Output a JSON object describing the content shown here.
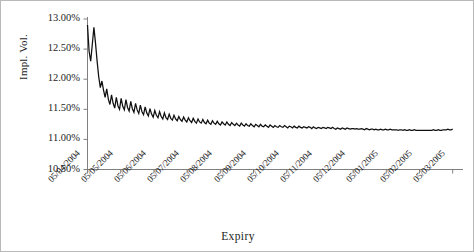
{
  "chart_data": {
    "type": "line",
    "title": "",
    "xlabel": "Expiry",
    "ylabel": "Impl. Vol.",
    "grid": false,
    "legend": false,
    "ylim": [
      10.5,
      13.0
    ],
    "ytick_labels": [
      "13.00%",
      "12.50%",
      "12.00%",
      "11.50%",
      "11.00%",
      "10.50%"
    ],
    "ytick_values": [
      13.0,
      12.5,
      12.0,
      11.5,
      11.0,
      10.5
    ],
    "xtick_labels": [
      "05/04/2004",
      "05/05/2004",
      "05/06/2004",
      "05/07/2004",
      "05/08/2004",
      "05/09/2004",
      "05/10/2004",
      "05/11/2004",
      "05/12/2004",
      "05/01/2005",
      "05/02/2005",
      "05/03/2005"
    ],
    "series": [
      {
        "name": "Implied Volatility",
        "color": "#101010",
        "values": [
          12.9,
          12.46,
          12.3,
          12.58,
          12.86,
          12.6,
          12.3,
          12.04,
          11.86,
          11.97,
          11.82,
          11.7,
          11.84,
          11.67,
          11.58,
          11.74,
          11.6,
          11.52,
          11.7,
          11.56,
          11.5,
          11.68,
          11.55,
          11.49,
          11.66,
          11.53,
          11.47,
          11.63,
          11.51,
          11.45,
          11.6,
          11.49,
          11.43,
          11.57,
          11.46,
          11.41,
          11.54,
          11.44,
          11.39,
          11.51,
          11.42,
          11.37,
          11.48,
          11.4,
          11.36,
          11.46,
          11.38,
          11.34,
          11.44,
          11.36,
          11.33,
          11.42,
          11.35,
          11.32,
          11.4,
          11.34,
          11.31,
          11.38,
          11.33,
          11.3,
          11.37,
          11.32,
          11.29,
          11.36,
          11.31,
          11.28,
          11.35,
          11.3,
          11.27,
          11.34,
          11.29,
          11.27,
          11.33,
          11.28,
          11.26,
          11.32,
          11.27,
          11.25,
          11.31,
          11.27,
          11.25,
          11.3,
          11.26,
          11.24,
          11.29,
          11.26,
          11.24,
          11.29,
          11.25,
          11.23,
          11.28,
          11.25,
          11.23,
          11.27,
          11.24,
          11.22,
          11.27,
          11.24,
          11.22,
          11.26,
          11.23,
          11.22,
          11.26,
          11.23,
          11.21,
          11.25,
          11.23,
          11.21,
          11.25,
          11.22,
          11.21,
          11.24,
          11.22,
          11.2,
          11.24,
          11.22,
          11.2,
          11.23,
          11.21,
          11.2,
          11.23,
          11.21,
          11.2,
          11.23,
          11.21,
          11.19,
          11.22,
          11.21,
          11.19,
          11.22,
          11.2,
          11.19,
          11.22,
          11.2,
          11.19,
          11.21,
          11.2,
          11.19,
          11.21,
          11.2,
          11.18,
          11.21,
          11.19,
          11.18,
          11.2,
          11.19,
          11.18,
          11.2,
          11.19,
          11.18,
          11.2,
          11.19,
          11.18,
          11.2,
          11.18,
          11.17,
          11.19,
          11.18,
          11.17,
          11.19,
          11.18,
          11.17,
          11.19,
          11.18,
          11.17,
          11.18,
          11.18,
          11.17,
          11.18,
          11.17,
          11.17,
          11.18,
          11.17,
          11.16,
          11.18,
          11.17,
          11.16,
          11.17,
          11.17,
          11.16,
          11.17,
          11.16,
          11.16,
          11.17,
          11.16,
          11.16,
          11.17,
          11.16,
          11.16,
          11.17,
          11.16,
          11.16,
          11.16,
          11.16,
          11.15,
          11.16,
          11.16,
          11.15,
          11.16,
          11.15,
          11.15,
          11.16,
          11.15,
          11.15,
          11.16,
          11.15,
          11.15,
          11.15,
          11.15,
          11.15,
          11.15,
          11.15,
          11.15,
          11.15,
          11.15,
          11.15,
          11.16,
          11.15,
          11.15,
          11.16,
          11.15,
          11.15,
          11.16,
          11.16,
          11.16,
          11.17,
          11.16,
          11.16,
          11.17
        ]
      }
    ]
  },
  "axes": {
    "x_domain_start_label": "05/04/2004",
    "x_domain_end_label": "05/03/2005"
  }
}
